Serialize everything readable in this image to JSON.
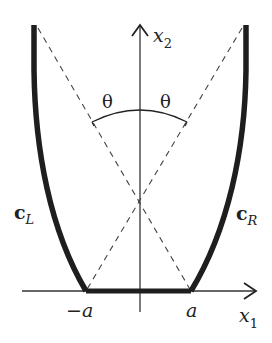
{
  "diagram": {
    "axes": {
      "vertical_label": "x",
      "vertical_sub": "2",
      "horizontal_label": "x",
      "horizontal_sub": "1"
    },
    "curves": {
      "left_label": "c",
      "left_sub": "L",
      "right_label": "c",
      "right_sub": "R"
    },
    "angles": {
      "left_theta": "θ",
      "right_theta": "θ"
    },
    "ticks": {
      "neg_a": "−a",
      "pos_a": "a"
    },
    "colors": {
      "stroke": "#222222",
      "background": "#ffffff"
    }
  }
}
